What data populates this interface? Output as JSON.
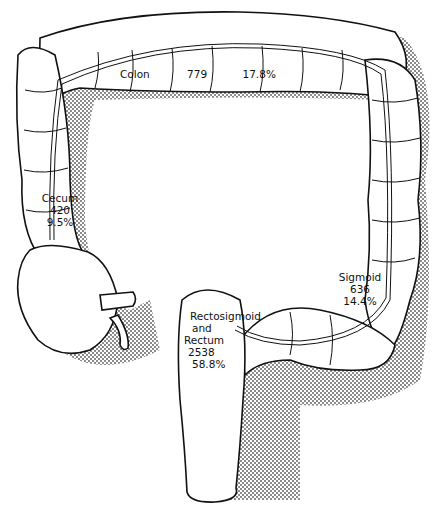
{
  "diagram": {
    "type": "anatomical illustration",
    "colors": {
      "outline": "#111111",
      "shadow_dots": "#555555",
      "fill": "#ffffff"
    }
  },
  "regions": {
    "colon": {
      "name": "Colon",
      "count": "779",
      "percent": "17.8%"
    },
    "cecum": {
      "name": "Cecum",
      "count": "420",
      "percent": "9.5%"
    },
    "sigmoid": {
      "name": "Sigmoid",
      "count": "636",
      "percent": "14.4%"
    },
    "rectum": {
      "name_line1": "Rectosigmoid",
      "name_line2": "and",
      "name_line3": "Rectum",
      "count": "2538",
      "percent": "58.8%"
    }
  }
}
